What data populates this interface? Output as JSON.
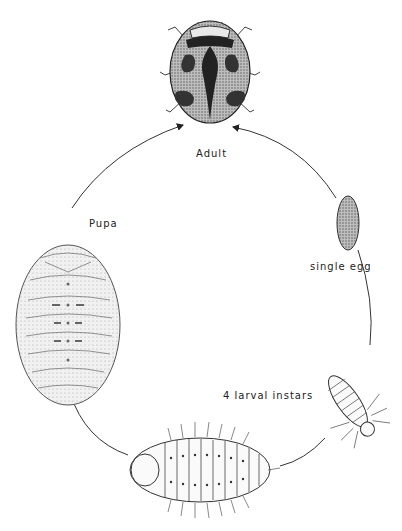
{
  "diagram": {
    "type": "life-cycle",
    "stages": [
      {
        "id": "adult",
        "label": "Adult"
      },
      {
        "id": "egg",
        "label": "single egg"
      },
      {
        "id": "larva",
        "label": "4 larval instars"
      },
      {
        "id": "pupa",
        "label": "Pupa"
      }
    ],
    "colors": {
      "ink": "#222222",
      "background": "#ffffff",
      "stipple": "#555555"
    }
  }
}
